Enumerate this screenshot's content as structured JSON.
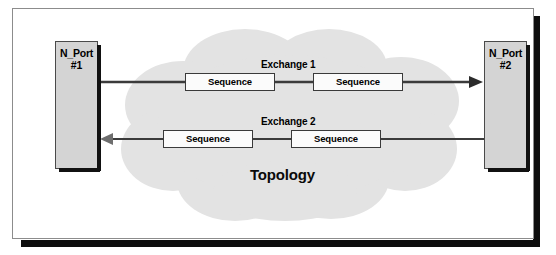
{
  "figure": {
    "caption": "Topology",
    "frame_border_color": "#8c8c8c",
    "shadow_color": "#0d0d0d",
    "background": "#ffffff"
  },
  "cloud": {
    "name": "network-cloud",
    "fill": "#e3e3e3",
    "label": "Topology"
  },
  "ports": [
    {
      "name": "n-port-1",
      "line1": "N_Port",
      "line2": "#1",
      "fill": "#d4d4d4"
    },
    {
      "name": "n-port-2",
      "line1": "N_Port",
      "line2": "#2",
      "fill": "#d4d4d4"
    }
  ],
  "exchanges": [
    {
      "label": "Exchange 1",
      "direction": "left-to-right",
      "sequences": [
        {
          "label": "Sequence"
        },
        {
          "label": "Sequence"
        }
      ]
    },
    {
      "label": "Exchange 2",
      "direction": "right-to-left",
      "sequences": [
        {
          "label": "Sequence"
        },
        {
          "label": "Sequence"
        }
      ]
    }
  ],
  "colors": {
    "line": "#3b3b3b",
    "box_border": "#3a3a3a",
    "box_fill": "#fbfbfb",
    "text": "#000000"
  }
}
